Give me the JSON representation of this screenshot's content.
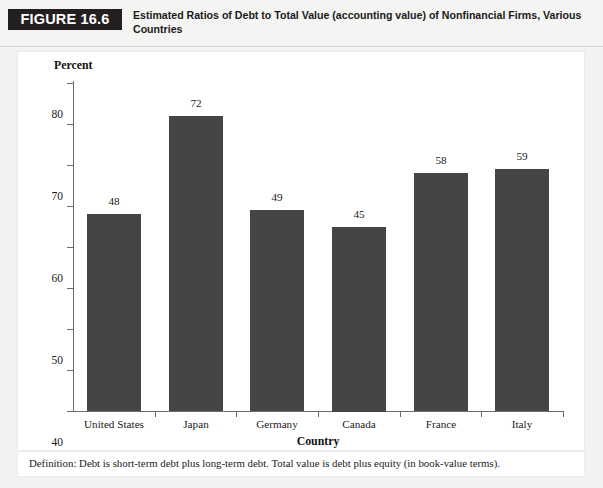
{
  "header": {
    "figure_tag": "FIGURE 16.6",
    "title": "Estimated Ratios of Debt to Total Value (accounting value) of Nonfinancial Firms, Various Countries"
  },
  "footnote": {
    "text": "Definition: Debt is short-term debt plus long-term debt. Total value is debt plus equity (in book-value terms)."
  },
  "colors": {
    "bar_fill": "#454545",
    "tag_background": "#231f20",
    "axis": "#6d6d6d",
    "card_background": "#ffffff",
    "page_background": "#f2f2f0"
  },
  "chart_data": {
    "type": "bar",
    "title": "Estimated Ratios of Debt to Total Value (accounting value) of Nonfinancial Firms, Various Countries",
    "xlabel": "Country",
    "ylabel": "Percent",
    "categories": [
      "United States",
      "Japan",
      "Germany",
      "Canada",
      "France",
      "Italy"
    ],
    "values": [
      48,
      72,
      49,
      45,
      58,
      59
    ],
    "data_labels": [
      "48",
      "72",
      "49",
      "45",
      "58",
      "59"
    ],
    "ylim": [
      0,
      80
    ],
    "ytick_values": [
      0,
      10,
      20,
      30,
      40,
      50,
      60,
      70,
      80
    ],
    "ytick_labels": [
      "0",
      "10",
      "20",
      "30",
      "40",
      "50",
      "60",
      "70",
      "80"
    ],
    "grid": false,
    "legend": false,
    "bar_color": "#454545"
  }
}
